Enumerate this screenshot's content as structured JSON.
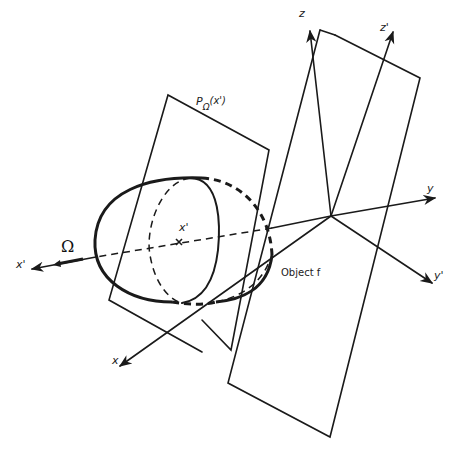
{
  "figure": {
    "labels": {
      "projection": "P",
      "projection_sub": "Ω",
      "projection_arg": "(x')",
      "z": "z",
      "z_prime": "z'",
      "y": "y",
      "y_prime": "y'",
      "x": "x",
      "x_prime_axis": "x'",
      "x_prime_center": "x'",
      "omega": "Ω",
      "object": "Object f"
    },
    "colors": {
      "stroke": "#1a1a1a",
      "background": "#ffffff"
    }
  }
}
